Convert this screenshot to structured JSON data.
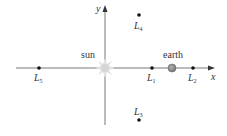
{
  "diagram": {
    "axes": {
      "x_label": "x",
      "y_label": "y",
      "color": "#555555"
    },
    "bodies": [
      {
        "name": "sun",
        "label": "sun",
        "color": "#d8d8d8"
      },
      {
        "name": "earth",
        "label": "earth",
        "color": "#888888"
      }
    ],
    "points": [
      {
        "id": "L1",
        "letter": "L",
        "sub": "1"
      },
      {
        "id": "L2",
        "letter": "L",
        "sub": "2"
      },
      {
        "id": "L3",
        "letter": "L",
        "sub": "3"
      },
      {
        "id": "L4",
        "letter": "L",
        "sub": "4"
      },
      {
        "id": "L5",
        "letter": "L",
        "sub": "5"
      }
    ],
    "point_color": "#111111"
  }
}
